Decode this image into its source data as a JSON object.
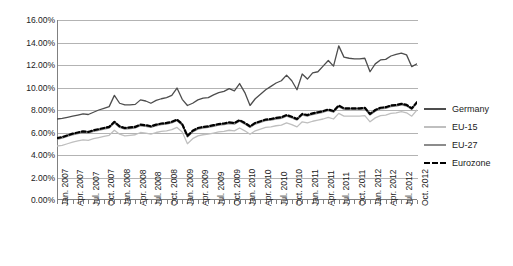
{
  "chart_data": {
    "type": "line",
    "title": "",
    "xlabel": "",
    "ylabel": "",
    "ylim": [
      0,
      16
    ],
    "ytick_labels": [
      "16.00%",
      "14.00%",
      "12.00%",
      "10.00%",
      "8.00%",
      "6.00%",
      "4.00%",
      "2.00%",
      "0.00%"
    ],
    "ytick_values": [
      16,
      14,
      12,
      10,
      8,
      6,
      4,
      2,
      0
    ],
    "grid": true,
    "legend_position": "right",
    "x_tick_labels": [
      "Jan. 2007",
      "Apr. 2007",
      "Jul. 2007",
      "Oct. 2007",
      "Jan. 2008",
      "Apr. 2008",
      "Jul. 2008",
      "Oct. 2008",
      "Jan. 2009",
      "Apr. 2009",
      "Jul. 2009",
      "Oct. 2009",
      "Jan. 2010",
      "Apr. 2010",
      "Jul. 2010",
      "Oct. 2010",
      "Jan. 2011",
      "Apr. 2011",
      "Jul. 2011",
      "Oct. 2011",
      "Jan. 2012",
      "Apr. 2012",
      "Jul. 2012",
      "Oct. 2012"
    ],
    "x_tick_label_interval_months": 3,
    "x_data_points": 70,
    "x_start": "Jan. 2007",
    "x_end": "Oct. 2012",
    "series": [
      {
        "name": "Germany",
        "color": "#4d4d4d",
        "style": "solid",
        "values": [
          7.2,
          7.25,
          7.35,
          7.45,
          7.55,
          7.65,
          7.6,
          7.8,
          8.0,
          8.15,
          8.3,
          9.3,
          8.6,
          8.45,
          8.45,
          8.5,
          8.9,
          8.8,
          8.6,
          8.85,
          9.0,
          9.1,
          9.3,
          9.95,
          8.95,
          8.4,
          8.6,
          8.9,
          9.05,
          9.1,
          9.35,
          9.55,
          9.65,
          9.9,
          9.7,
          10.35,
          9.55,
          8.4,
          9.0,
          9.4,
          9.8,
          10.1,
          10.4,
          10.6,
          11.1,
          10.6,
          9.8,
          11.2,
          10.75,
          11.3,
          11.4,
          11.9,
          12.4,
          11.9,
          13.7,
          12.7,
          12.6,
          12.55,
          12.55,
          12.6,
          11.4,
          12.1,
          12.45,
          12.5,
          12.8,
          12.95,
          13.05,
          12.9,
          11.85,
          12.1
        ]
      },
      {
        "name": "EU-15",
        "color": "#bfbfbf",
        "style": "solid",
        "values": [
          4.8,
          4.85,
          5.0,
          5.15,
          5.25,
          5.35,
          5.3,
          5.45,
          5.55,
          5.65,
          5.75,
          6.2,
          5.85,
          5.7,
          5.75,
          5.8,
          6.0,
          5.95,
          5.85,
          6.0,
          6.1,
          6.15,
          6.25,
          6.45,
          6.05,
          5.0,
          5.45,
          5.7,
          5.8,
          5.85,
          5.95,
          6.05,
          6.1,
          6.2,
          6.15,
          6.4,
          6.15,
          5.85,
          6.15,
          6.3,
          6.45,
          6.5,
          6.6,
          6.65,
          6.85,
          6.7,
          6.5,
          6.95,
          6.85,
          7.0,
          7.1,
          7.2,
          7.35,
          7.2,
          7.7,
          7.45,
          7.45,
          7.45,
          7.45,
          7.5,
          6.95,
          7.3,
          7.5,
          7.55,
          7.7,
          7.75,
          7.85,
          7.75,
          7.45,
          8.0
        ]
      },
      {
        "name": "EU-27",
        "color": "#8c8c8c",
        "style": "solid",
        "values": [
          5.4,
          5.5,
          5.65,
          5.8,
          5.9,
          6.0,
          5.95,
          6.1,
          6.2,
          6.3,
          6.4,
          6.85,
          6.45,
          6.3,
          6.35,
          6.4,
          6.6,
          6.55,
          6.45,
          6.6,
          6.7,
          6.75,
          6.85,
          7.05,
          6.65,
          5.6,
          6.05,
          6.3,
          6.4,
          6.45,
          6.55,
          6.65,
          6.7,
          6.8,
          6.75,
          7.0,
          6.75,
          6.45,
          6.75,
          6.9,
          7.05,
          7.1,
          7.2,
          7.25,
          7.45,
          7.3,
          7.1,
          7.55,
          7.45,
          7.6,
          7.7,
          7.8,
          7.95,
          7.8,
          8.3,
          8.05,
          8.05,
          8.05,
          8.05,
          8.1,
          7.55,
          7.9,
          8.1,
          8.15,
          8.3,
          8.35,
          8.45,
          8.35,
          8.05,
          8.6
        ]
      },
      {
        "name": "Eurozone",
        "color": "#000000",
        "style": "dashed",
        "values": [
          5.5,
          5.6,
          5.75,
          5.9,
          6.0,
          6.1,
          6.05,
          6.2,
          6.3,
          6.4,
          6.5,
          6.95,
          6.55,
          6.4,
          6.45,
          6.5,
          6.7,
          6.65,
          6.55,
          6.7,
          6.8,
          6.85,
          6.95,
          7.15,
          6.75,
          5.7,
          6.15,
          6.4,
          6.5,
          6.55,
          6.65,
          6.75,
          6.8,
          6.9,
          6.85,
          7.1,
          6.85,
          6.55,
          6.85,
          7.0,
          7.15,
          7.2,
          7.3,
          7.35,
          7.55,
          7.4,
          7.2,
          7.65,
          7.55,
          7.7,
          7.8,
          7.9,
          8.05,
          7.9,
          8.4,
          8.15,
          8.15,
          8.15,
          8.15,
          8.2,
          7.65,
          8.0,
          8.2,
          8.25,
          8.4,
          8.45,
          8.55,
          8.45,
          8.15,
          8.7
        ]
      }
    ]
  },
  "legend": {
    "items": [
      {
        "label": "Germany"
      },
      {
        "label": "EU-15"
      },
      {
        "label": "EU-27"
      },
      {
        "label": "Eurozone"
      }
    ]
  }
}
